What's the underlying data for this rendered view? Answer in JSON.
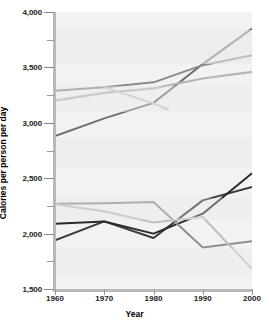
{
  "chart_data": {
    "type": "line",
    "title": "",
    "xlabel": "Year",
    "ylabel": "Calories per person per day",
    "xlim": [
      1960,
      2000
    ],
    "ylim": [
      1500,
      4000
    ],
    "ytick_labels": [
      "4,000",
      "3,500",
      "3,000",
      "2,500",
      "2,000",
      "1,500"
    ],
    "ytick_values": [
      4000,
      3500,
      3000,
      2500,
      2000,
      1500
    ],
    "yminor_values": [
      3750,
      3250,
      2750,
      2250,
      1750
    ],
    "xtick_labels": [
      "1960",
      "1970",
      "1980",
      "1990",
      "2000"
    ],
    "xtick_values": [
      1960,
      1970,
      1980,
      1990,
      2000
    ],
    "grid": false,
    "legend": "none",
    "series": [
      {
        "name": "upper-rising-dark",
        "color": "#6e6e6e",
        "width": 2.0,
        "x": [
          1960,
          1970,
          1980,
          1990,
          2000
        ],
        "values": [
          2880,
          3040,
          3180,
          3530,
          3850
        ]
      },
      {
        "name": "upper-midtone-plateau",
        "color": "#8a8a8a",
        "width": 2.0,
        "x": [
          1960,
          1970,
          1980,
          1990,
          2000
        ],
        "values": [
          3290,
          3320,
          3365,
          3520,
          3610
        ]
      },
      {
        "name": "upper-light-steady",
        "color": "#b5b5b5",
        "width": 2.2,
        "x": [
          1960,
          1970,
          1980,
          1990,
          2000
        ],
        "values": [
          3200,
          3270,
          3310,
          3400,
          3460
        ]
      },
      {
        "name": "upper-light-declining-short",
        "color": "#c4c4c4",
        "width": 2.0,
        "x": [
          1970,
          1980,
          1983
        ],
        "values": [
          3320,
          3175,
          3120
        ]
      },
      {
        "name": "lower-dark-rising",
        "color": "#3a3a3a",
        "width": 2.0,
        "x": [
          1960,
          1970,
          1980,
          1990,
          2000
        ],
        "values": [
          1940,
          2110,
          1960,
          2300,
          2420
        ]
      },
      {
        "name": "lower-black-flat-then-rising",
        "color": "#2b2b2b",
        "width": 2.0,
        "x": [
          1960,
          1970,
          1980,
          1990,
          2000
        ],
        "values": [
          2090,
          2110,
          2000,
          2180,
          2545
        ]
      },
      {
        "name": "lower-gray-plateau-drop",
        "color": "#8f8f8f",
        "width": 2.0,
        "x": [
          1960,
          1970,
          1980,
          1990,
          2000
        ],
        "values": [
          2270,
          2275,
          2285,
          1875,
          1930
        ]
      },
      {
        "name": "lower-light-declining",
        "color": "#c0c0c0",
        "width": 2.2,
        "x": [
          1960,
          1970,
          1980,
          1990,
          2000
        ],
        "values": [
          2265,
          2200,
          2100,
          2150,
          1680
        ]
      }
    ]
  }
}
